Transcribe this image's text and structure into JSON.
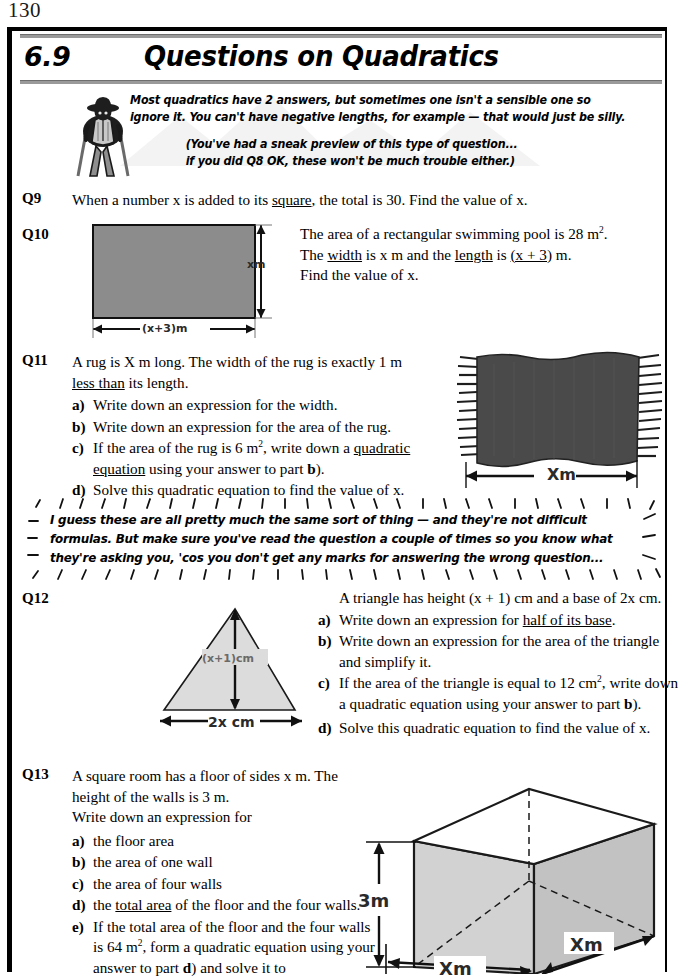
{
  "page": {
    "number": "130",
    "section_number": "6.9",
    "section_title": "Questions on Quadratics"
  },
  "intro": {
    "line1": "Most quadratics have 2 answers, but sometimes one isn't a sensible one so",
    "line2": "ignore it.  You can't have negative lengths, for example — that would just be silly.",
    "line3": "(You've had a sneak preview of this type of question...",
    "line4": "if you did Q8 OK, these won't be much trouble either.)"
  },
  "questions": {
    "q9": {
      "label": "Q9",
      "text_a": "When a number x is added to its ",
      "text_underlined": "square",
      "text_b": ", the total is 30.  Find the value of x."
    },
    "q10": {
      "label": "Q10",
      "line1_a": "The area of a rectangular swimming pool is 28 m",
      "line1_sup": "2",
      "line1_b": ".",
      "line2_a": "The ",
      "line2_u1": "width",
      "line2_b": " is x m and the ",
      "line2_u2": "length",
      "line2_c": " is ",
      "line2_u3": "(x + 3)",
      "line2_d": " m.",
      "line3": "Find the value of x.",
      "diagram": {
        "name": "swimming-pool-rectangle",
        "width_label": "(x+3)m",
        "height_label": "xm",
        "fill_color": "#8c8c8c"
      }
    },
    "q11": {
      "label": "Q11",
      "line1": "A rug is X m long.  The width of the rug is exactly 1 m",
      "line2_u": "less than",
      "line2_b": " its length.",
      "parts": [
        {
          "mark": "a)",
          "text": "Write down an expression for the width."
        },
        {
          "mark": "b)",
          "text": "Write down an expression for the area of the rug."
        },
        {
          "mark": "c)",
          "text_a": "If the area of the rug is 6 m",
          "sup": "2",
          "text_b": ", write down a ",
          "u": "quadratic equation",
          "text_c": " using your answer to part ",
          "bold": "b",
          "text_d": ")."
        },
        {
          "mark": "d)",
          "text": "Solve this quadratic equation to find the value of x."
        }
      ],
      "diagram": {
        "name": "rug-illustration",
        "width_label": "Xm",
        "fill_color": "#4a4a4a"
      }
    },
    "note": {
      "line1": "I guess these are all pretty much the same sort of thing — and they're not difficult",
      "line2": "formulas.  But make sure you've read the question a couple of times so you know what",
      "line3": "they're asking you, 'cos you don't get any marks for answering the wrong question..."
    },
    "q12": {
      "label": "Q12",
      "intro_a": "A triangle has height (x + 1) cm and a base of 2x cm.",
      "parts": [
        {
          "mark": "a)",
          "text_a": "Write down an expression for ",
          "u": "half of its base",
          "text_b": "."
        },
        {
          "mark": "b)",
          "text_a": "Write down an expression for the area of the triangle and simplify it."
        },
        {
          "mark": "c)",
          "text_a": "If the area of the triangle is equal to 12 cm",
          "sup": "2",
          "text_b": ", write down a quadratic equation using your answer to part ",
          "bold": "b",
          "text_c": ")."
        },
        {
          "mark": "d)",
          "text_a": "Solve this quadratic equation to find the value of x."
        }
      ],
      "diagram": {
        "name": "triangle-diagram",
        "height_label": "(x+1)cm",
        "base_label": "2x cm",
        "fill_color": "#dcdcdc"
      }
    },
    "q13": {
      "label": "Q13",
      "line1": "A square room has a floor of sides x m.  The",
      "line2": "height of the walls is 3 m.",
      "line3": "Write down an expression for",
      "parts": [
        {
          "mark": "a)",
          "text": "the floor area"
        },
        {
          "mark": "b)",
          "text": "the area of one wall"
        },
        {
          "mark": "c)",
          "text": "the area of four walls"
        },
        {
          "mark": "d)",
          "text_a": "the ",
          "u": "total area",
          "text_b": " of the floor and the four walls."
        },
        {
          "mark": "e)",
          "text_a": "If the total area of the floor and the four walls is 64 m",
          "sup": "2",
          "text_b": ", form a quadratic equation using your answer to part ",
          "bold": "d",
          "text_c": ") and solve it to"
        }
      ],
      "diagram": {
        "name": "room-cuboid-diagram",
        "height_label": "3m",
        "width_label_front": "Xm",
        "width_label_side": "Xm",
        "fill_color": "#d2d2d2"
      }
    }
  }
}
